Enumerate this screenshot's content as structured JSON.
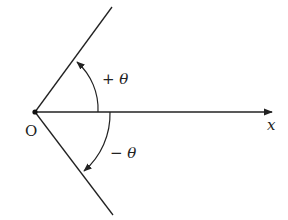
{
  "diagram": {
    "origin_label": "O",
    "axis_label": "x",
    "positive_angle_label": "+ θ",
    "negative_angle_label": "− θ",
    "colors": {
      "stroke": "#222222",
      "background": "#ffffff"
    },
    "geometry": {
      "origin": [
        35,
        112
      ],
      "x_axis_end": [
        272,
        112
      ],
      "upper_ray_end": [
        112,
        7
      ],
      "lower_ray_end": [
        113,
        215
      ]
    }
  }
}
